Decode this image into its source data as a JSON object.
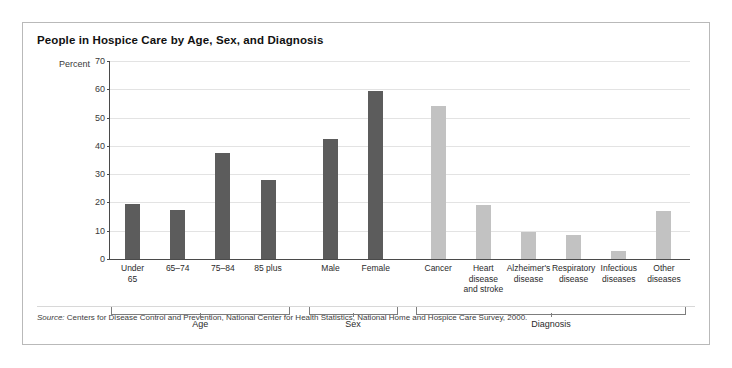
{
  "title": "People in Hospice Care by Age, Sex, and Diagnosis",
  "axis": {
    "ylabel": "Percent"
  },
  "source": {
    "prefix": "Source:",
    "text": " Centers for Disease Control and Prevention, National Center for Health Statistics, National Home and Hospice Care Survey, 2000."
  },
  "groups": [
    {
      "name": "Age"
    },
    {
      "name": "Sex"
    },
    {
      "name": "Diagnosis"
    }
  ],
  "colors": {
    "dark_bar": "#5c5c5c",
    "light_bar": "#c2c2c2",
    "grid": "#e3e3e3",
    "axis": "#4a4a4a",
    "border": "#b9b9b9"
  },
  "chart_data": {
    "type": "bar",
    "title": "People in Hospice Care by Age, Sex, and Diagnosis",
    "xlabel": "",
    "ylabel": "Percent",
    "ylim": [
      0,
      70
    ],
    "yticks": [
      0,
      10,
      20,
      30,
      40,
      50,
      60,
      70
    ],
    "grid": true,
    "legend": "none",
    "categories": [
      "Under\n65",
      "65–74",
      "75–84",
      "85 plus",
      "Male",
      "Female",
      "Cancer",
      "Heart\ndisease\nand stroke",
      "Alzheimer's\ndisease",
      "Respiratory\ndisease",
      "Infectious\ndiseases",
      "Other\ndiseases"
    ],
    "values": [
      19.5,
      17.5,
      37.5,
      27.8,
      42.5,
      59.5,
      54,
      19,
      9.5,
      8.5,
      3,
      17
    ],
    "bar_colors": [
      "dark",
      "dark",
      "dark",
      "dark",
      "dark",
      "dark",
      "light",
      "light",
      "light",
      "light",
      "light",
      "light"
    ],
    "groups": [
      {
        "label": "Age",
        "categories": [
          "Under\n65",
          "65–74",
          "75–84",
          "85 plus"
        ]
      },
      {
        "label": "Sex",
        "categories": [
          "Male",
          "Female"
        ]
      },
      {
        "label": "Diagnosis",
        "categories": [
          "Cancer",
          "Heart\ndisease\nand stroke",
          "Alzheimer's\ndisease",
          "Respiratory\ndisease",
          "Infectious\ndiseases",
          "Other\ndiseases"
        ]
      }
    ]
  }
}
